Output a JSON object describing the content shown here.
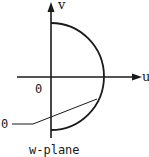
{
  "diagram": {
    "title": "w-plane",
    "axes": {
      "horizontal_label": "u",
      "vertical_label": "v",
      "origin_label": "0"
    },
    "curve": {
      "type": "semicircle",
      "side": "right half-plane",
      "leader_label": "0"
    },
    "colors": {
      "stroke": "#1a1a1a",
      "background": "#ffffff"
    }
  }
}
